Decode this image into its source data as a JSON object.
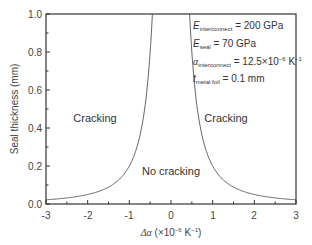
{
  "chart_data": {
    "type": "line",
    "title": "",
    "xlabel": "Δα (×10⁻⁶ K⁻¹)",
    "ylabel": "Seal thickness (mm)",
    "xlim": [
      -3,
      3
    ],
    "ylim": [
      0.0,
      1.0
    ],
    "xticks": [
      "-3",
      "-2",
      "-1",
      "0",
      "1",
      "2",
      "3"
    ],
    "yticks": [
      "0.0",
      "0.2",
      "0.4",
      "0.6",
      "0.8",
      "1.0"
    ],
    "grid": false,
    "series": [
      {
        "name": "Critical seal thickness",
        "x": [
          -3,
          -2.5,
          -2,
          -1.5,
          -1,
          -0.75,
          -0.6,
          -0.5,
          -0.45,
          0.45,
          0.5,
          0.6,
          0.75,
          1,
          1.5,
          2,
          2.5,
          3
        ],
        "y": [
          0.022,
          0.032,
          0.05,
          0.089,
          0.2,
          0.356,
          0.556,
          0.8,
          1.0,
          1.0,
          0.8,
          0.556,
          0.356,
          0.2,
          0.089,
          0.05,
          0.032,
          0.022
        ]
      }
    ],
    "annotations": [
      {
        "text": "Cracking",
        "x": -1.8,
        "y": 0.45
      },
      {
        "text": "Cracking",
        "x": 1.2,
        "y": 0.45
      },
      {
        "text": "No cracking",
        "x": 0.0,
        "y": 0.15
      },
      {
        "text": "E_interconnect = 200 GPa"
      },
      {
        "text": "E_seal = 70 GPa"
      },
      {
        "text": "α_interconnect = 12.5×10⁻⁶ K⁻¹"
      },
      {
        "text": "t_metal foil = 0.1 mm"
      }
    ]
  },
  "labels": {
    "ylabel": "Seal thickness (mm)",
    "xlabel_prefix": "Δα",
    "xlabel_unit": " (×10",
    "xlabel_exp": "−6",
    "xlabel_k": " K",
    "xlabel_kexp": "−1",
    "xlabel_close": ")",
    "region_left": "Cracking",
    "region_right": "Cracking",
    "region_bottom": "No cracking"
  },
  "params": {
    "e_inter_sym": "E",
    "e_inter_sub": "interconnect",
    "e_inter_val": " = 200 GPa",
    "e_seal_sym": "E",
    "e_seal_sub": "seal",
    "e_seal_val": " = 70 GPa",
    "alpha_sym": "α",
    "alpha_sub": "interconnect",
    "alpha_val": " = 12.5×10",
    "alpha_exp": "−6",
    "alpha_k": " K",
    "alpha_kexp": "−1",
    "t_sym": "t",
    "t_sub": "metal foil",
    "t_val": " = 0.1 mm"
  },
  "colors": {
    "curve": "#555555",
    "axis": "#333333"
  }
}
